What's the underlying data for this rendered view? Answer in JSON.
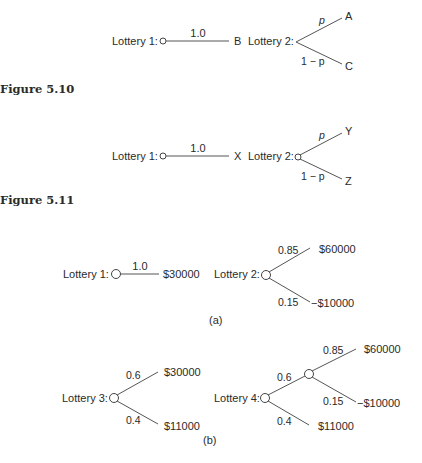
{
  "figures": [
    {
      "caption": "Figure 5.10",
      "lottery1": {
        "label": "Lottery 1:",
        "prob": "1.0",
        "outcome": "B"
      },
      "lottery2": {
        "label": "Lottery 2:",
        "upper_prob": "p",
        "upper_outcome": "A",
        "lower_prob": "1 − p",
        "lower_outcome": "C"
      }
    },
    {
      "caption": "Figure 5.11",
      "lottery1": {
        "label": "Lottery 1:",
        "prob": "1.0",
        "outcome": "X"
      },
      "lottery2": {
        "label": "Lottery 2:",
        "upper_prob": "p",
        "upper_outcome": "Y",
        "lower_prob": "1 − p",
        "lower_outcome": "Z"
      }
    },
    {
      "panel_a": {
        "sublabel": "(a)",
        "lottery1": {
          "label": "Lottery 1:",
          "prob": "1.0",
          "outcome": "$30000"
        },
        "lottery2": {
          "label": "Lottery 2:",
          "upper_prob": "0.85",
          "upper_outcome": "$60000",
          "lower_prob": "0.15",
          "lower_outcome": "−$10000"
        }
      },
      "panel_b": {
        "sublabel": "(b)",
        "lottery3": {
          "label": "Lottery 3:",
          "upper_prob": "0.6",
          "upper_outcome": "$30000",
          "lower_prob": "0.4",
          "lower_outcome": "$11000"
        },
        "lottery4": {
          "label": "Lottery 4:",
          "upper_prob": "0.6",
          "lower_prob": "0.4",
          "lower_outcome": "$11000",
          "sub_upper_prob": "0.85",
          "sub_upper_outcome": "$60000",
          "sub_lower_prob": "0.15",
          "sub_lower_outcome": "−$10000"
        }
      }
    }
  ]
}
